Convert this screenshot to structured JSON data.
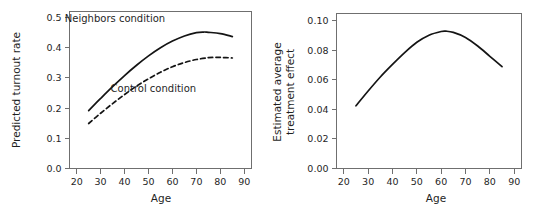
{
  "figure": {
    "background_color": "#ffffff",
    "frame_color": "#6f6f6f",
    "curve_color": "#141414"
  },
  "chart_data": [
    {
      "type": "line",
      "panel": "left",
      "title": "",
      "xlabel": "Age",
      "ylabel": "Predicted turnout rate",
      "xlim": [
        17,
        93
      ],
      "ylim": [
        0.0,
        0.52
      ],
      "xticks": [
        20,
        30,
        40,
        50,
        60,
        70,
        80,
        90
      ],
      "xticklabels": [
        "20",
        "30",
        "40",
        "50",
        "60",
        "70",
        "80",
        "90"
      ],
      "yticks": [
        0.0,
        0.1,
        0.2,
        0.3,
        0.4,
        0.5
      ],
      "yticklabels": [
        "0.0",
        "0.1",
        "0.2",
        "0.3",
        "0.4",
        "0.5"
      ],
      "grid": false,
      "legend": "inline-annotations",
      "annotations": [
        {
          "text": "Neighbors condition",
          "x": 36,
          "y": 0.485
        },
        {
          "text": "Control condition",
          "x": 52,
          "y": 0.255
        }
      ],
      "series": [
        {
          "name": "Neighbors condition",
          "style": "solid",
          "x": [
            25,
            30,
            35,
            40,
            45,
            50,
            55,
            60,
            65,
            70,
            73,
            75,
            80,
            85
          ],
          "values": [
            0.192,
            0.232,
            0.271,
            0.308,
            0.342,
            0.373,
            0.4,
            0.422,
            0.439,
            0.45,
            0.452,
            0.451,
            0.447,
            0.437
          ]
        },
        {
          "name": "Control condition",
          "style": "dashed",
          "x": [
            25,
            30,
            35,
            40,
            45,
            50,
            55,
            60,
            65,
            70,
            75,
            78,
            80,
            85
          ],
          "values": [
            0.149,
            0.183,
            0.215,
            0.245,
            0.273,
            0.297,
            0.319,
            0.337,
            0.351,
            0.361,
            0.367,
            0.368,
            0.368,
            0.366
          ]
        }
      ]
    },
    {
      "type": "line",
      "panel": "right",
      "title": "",
      "xlabel": "Age",
      "ylabel": "Estimated average\ntreatment effect",
      "ylabel_line1": "Estimated average",
      "ylabel_line2": "treatment effect",
      "xlim": [
        17,
        93
      ],
      "ylim": [
        0.0,
        0.105
      ],
      "xticks": [
        20,
        30,
        40,
        50,
        60,
        70,
        80,
        90
      ],
      "xticklabels": [
        "20",
        "30",
        "40",
        "50",
        "60",
        "70",
        "80",
        "90"
      ],
      "yticks": [
        0.0,
        0.02,
        0.04,
        0.06,
        0.08,
        0.1
      ],
      "yticklabels": [
        "0.00",
        "0.02",
        "0.04",
        "0.06",
        "0.08",
        "0.10"
      ],
      "grid": false,
      "legend": "none",
      "annotations": [],
      "series": [
        {
          "name": "Estimated average treatment effect",
          "style": "solid",
          "x": [
            25,
            30,
            35,
            40,
            45,
            50,
            55,
            60,
            62,
            65,
            70,
            75,
            80,
            85
          ],
          "values": [
            0.0425,
            0.0525,
            0.062,
            0.0705,
            0.0785,
            0.0855,
            0.0903,
            0.0928,
            0.093,
            0.0922,
            0.0888,
            0.083,
            0.076,
            0.069
          ]
        }
      ]
    }
  ]
}
